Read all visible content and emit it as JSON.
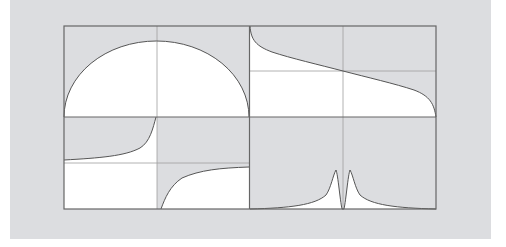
{
  "figure": {
    "background_color": "#dcdde0",
    "plot_fill_color": "#ffffff",
    "curve_color": "#555555",
    "frame_color": "#666666",
    "grid_color": "#999999"
  },
  "panels": [
    {
      "id": "top-left",
      "shape": "semi-ellipse (concave-down arch)"
    },
    {
      "id": "top-right",
      "shape": "decreasing inverse-tangent-like curve (arccos-like)"
    },
    {
      "id": "bottom-left",
      "shape": "tangent-like curve with vertical asymptote at center"
    },
    {
      "id": "bottom-right",
      "shape": "twin Lorentzian peaks with central dip"
    }
  ]
}
